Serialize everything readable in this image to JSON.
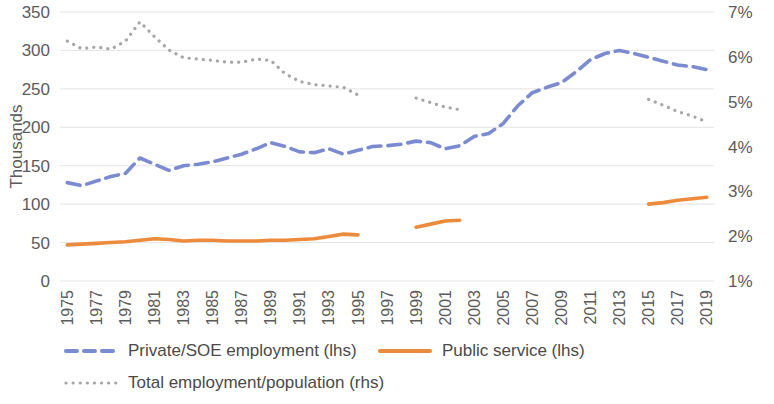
{
  "chart_data": {
    "type": "line",
    "title": "",
    "xlabel": "",
    "ylabel": "Thousands",
    "y2label": "",
    "ylim": [
      0,
      350
    ],
    "y2lim": [
      1,
      7
    ],
    "grid": true,
    "legend_position": "bottom",
    "x": [
      1975,
      1976,
      1977,
      1978,
      1979,
      1980,
      1981,
      1982,
      1983,
      1984,
      1985,
      1986,
      1987,
      1988,
      1989,
      1990,
      1991,
      1992,
      1993,
      1994,
      1995,
      1996,
      1997,
      1998,
      1999,
      2000,
      2001,
      2002,
      2003,
      2004,
      2005,
      2006,
      2007,
      2008,
      2009,
      2010,
      2011,
      2012,
      2013,
      2014,
      2015,
      2016,
      2017,
      2018,
      2019
    ],
    "xtick_labels": [
      "1975",
      "1977",
      "1979",
      "1981",
      "1983",
      "1985",
      "1987",
      "1989",
      "1991",
      "1993",
      "1995",
      "1997",
      "1999",
      "2001",
      "2003",
      "2005",
      "2007",
      "2009",
      "2011",
      "2013",
      "2015",
      "2017",
      "2019"
    ],
    "ytick_labels": [
      "0",
      "50",
      "100",
      "150",
      "200",
      "250",
      "300",
      "350"
    ],
    "y2tick_labels": [
      "1%",
      "2%",
      "3%",
      "4%",
      "5%",
      "6%",
      "7%"
    ],
    "series": [
      {
        "name": "Private/SOE employment (lhs)",
        "axis": "left",
        "style": "dashed",
        "color": "#7B8BD1",
        "values": [
          128,
          124,
          130,
          136,
          140,
          160,
          152,
          144,
          150,
          152,
          155,
          160,
          165,
          172,
          180,
          175,
          168,
          167,
          172,
          165,
          170,
          175,
          176,
          178,
          182,
          180,
          172,
          176,
          188,
          192,
          205,
          228,
          245,
          252,
          258,
          272,
          288,
          296,
          300,
          296,
          291,
          286,
          281,
          279,
          275
        ]
      },
      {
        "name": "Public service (lhs)",
        "axis": "left",
        "style": "solid",
        "color": "#ED8B3C",
        "values": [
          47,
          48,
          49,
          50,
          51,
          53,
          55,
          54,
          52,
          53,
          53,
          52,
          52,
          52,
          53,
          53,
          54,
          55,
          58,
          61,
          60,
          null,
          null,
          null,
          70,
          74,
          78,
          79,
          null,
          null,
          null,
          null,
          null,
          null,
          null,
          null,
          null,
          null,
          null,
          null,
          100,
          102,
          105,
          107,
          109
        ]
      },
      {
        "name": "Total employment/population (rhs)",
        "axis": "right",
        "style": "dotted",
        "color": "#A6A6A6",
        "values": [
          6.35,
          6.18,
          6.22,
          6.17,
          6.35,
          6.78,
          6.45,
          6.15,
          5.98,
          5.95,
          5.92,
          5.88,
          5.88,
          5.95,
          5.92,
          5.62,
          5.45,
          5.38,
          5.35,
          5.32,
          5.15,
          null,
          null,
          null,
          5.08,
          4.98,
          4.88,
          4.82,
          null,
          null,
          null,
          null,
          null,
          null,
          null,
          null,
          null,
          null,
          null,
          null,
          5.05,
          4.92,
          4.78,
          4.68,
          4.55
        ]
      }
    ]
  },
  "legend": {
    "items": [
      {
        "label": "Private/SOE employment (lhs)",
        "color": "#7B8BD1",
        "style": "dashed"
      },
      {
        "label": "Public service (lhs)",
        "color": "#ED8B3C",
        "style": "solid"
      },
      {
        "label": "Total employment/population (rhs)",
        "color": "#A6A6A6",
        "style": "dotted"
      }
    ]
  },
  "axes": {
    "left_title": "Thousands"
  },
  "colors": {
    "private": "#7B8BD1",
    "public": "#ED8B3C",
    "total": "#A6A6A6",
    "grid": "#E4E4E4",
    "text": "#5B5B5B"
  }
}
